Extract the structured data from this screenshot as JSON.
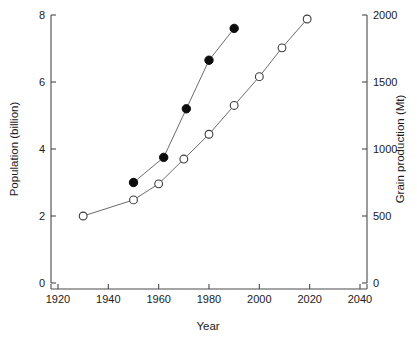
{
  "chart_data": {
    "type": "line",
    "title": "",
    "xlabel": "Year",
    "ylabel": "Population (billion)",
    "y2label": "Grain production (Mt)",
    "xlim": [
      1920,
      2040
    ],
    "ylim": [
      0,
      8
    ],
    "y2lim": [
      0,
      2000
    ],
    "xticks": [
      1920,
      1940,
      1960,
      1980,
      2000,
      2020,
      2040
    ],
    "xtick_labels": [
      "1920",
      "1940",
      "1960",
      "1980",
      "2000",
      "2020",
      "2040"
    ],
    "yticks": [
      0,
      2,
      4,
      6,
      8
    ],
    "ytick_labels": [
      "0",
      "2",
      "4",
      "6",
      "8"
    ],
    "y2ticks": [
      0,
      500,
      1000,
      1500,
      2000
    ],
    "y2tick_labels": [
      "0",
      "500",
      "1000",
      "1500",
      "2000"
    ],
    "grid": false,
    "legend": "none",
    "series": [
      {
        "name": "Population (billion)",
        "marker": "filled-circle",
        "axis": "left",
        "color": "#0d0d0d",
        "x": [
          1950,
          1962,
          1971,
          1980,
          1990
        ],
        "values": [
          3.0,
          3.75,
          5.2,
          6.65,
          7.6
        ]
      },
      {
        "name": "Grain production (Mt)",
        "marker": "open-circle",
        "axis": "right",
        "color": "#3c3c3c",
        "x": [
          1930,
          1950,
          1960,
          1970,
          1980,
          1990,
          2000,
          2009,
          2019
        ],
        "values": [
          500,
          620,
          740,
          925,
          1110,
          1325,
          1540,
          1755,
          1970
        ]
      }
    ]
  }
}
